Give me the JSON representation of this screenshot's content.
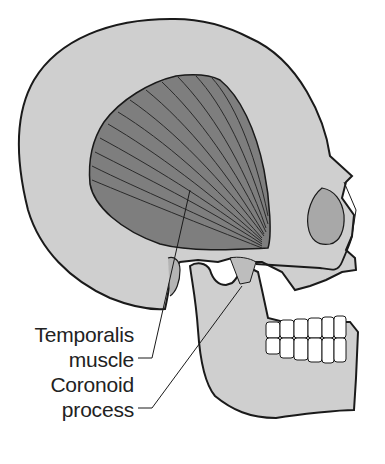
{
  "figure": {
    "colors": {
      "bone": "#cfcfcf",
      "muscle": "#7e7e7e",
      "outline": "#1a1a1a",
      "teeth": "#ffffff",
      "orbit": "#a8a8a8"
    }
  },
  "labels": [
    {
      "id": "temporalis",
      "line1": "Temporalis",
      "line2": "muscle"
    },
    {
      "id": "coronoid",
      "line1": "Coronoid",
      "line2": "process"
    }
  ]
}
